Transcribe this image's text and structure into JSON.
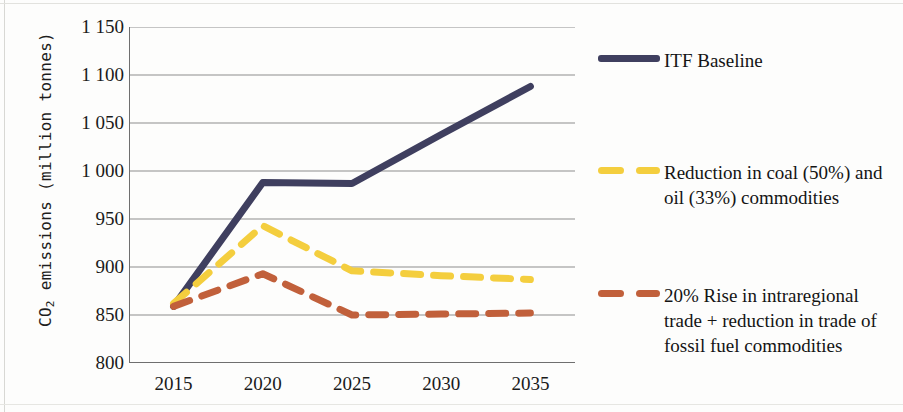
{
  "chart_data": {
    "type": "line",
    "title": "",
    "xlabel": "",
    "ylabel": "CO2 emissions (million tonnes)",
    "ylabel_parts": {
      "pre": "CO",
      "sub": "2",
      "post": " emissions (million tonnes)"
    },
    "categories": [
      "2015",
      "2020",
      "2025",
      "2030",
      "2035"
    ],
    "x_tick_labels": [
      "2015",
      "2020",
      "2025",
      "2030",
      "2035"
    ],
    "y_tick_labels": [
      "1 150",
      "1 100",
      "1 050",
      "1 000",
      "950",
      "900",
      "850",
      "800"
    ],
    "y_tick_values": [
      1150,
      1100,
      1050,
      1000,
      950,
      900,
      850,
      800
    ],
    "ylim": [
      800,
      1150
    ],
    "grid": true,
    "legend_position": "right",
    "series": [
      {
        "name": "ITF Baseline",
        "color": "#3f3f5f",
        "style": "solid",
        "values": [
          859,
          988,
          987,
          1038,
          1088
        ]
      },
      {
        "name": "Reduction in coal (50%) and oil (33%) commodities",
        "color": "#f4ce3e",
        "style": "dashed",
        "values": [
          862,
          943,
          896,
          891,
          887
        ]
      },
      {
        "name": "20% Rise in intraregional trade + reduction in trade of fossil fuel commodities",
        "color": "#c1603b",
        "style": "dashed",
        "values": [
          859,
          893,
          850,
          851,
          852
        ]
      }
    ]
  },
  "legend": {
    "items": [
      {
        "label": "ITF Baseline",
        "color": "#3f3f5f",
        "style": "solid"
      },
      {
        "label": "Reduction in coal (50%) and oil (33%) commodities",
        "color": "#f4ce3e",
        "style": "dashed"
      },
      {
        "label": "20% Rise in intraregional trade +  reduction in trade of fossil fuel commodities",
        "color": "#c1603b",
        "style": "dashed"
      }
    ]
  }
}
